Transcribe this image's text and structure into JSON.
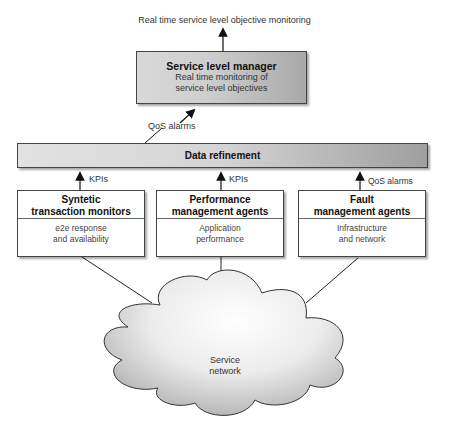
{
  "diagram": {
    "top_output_label": "Real time service level objective monitoring",
    "service_level_manager": {
      "title": "Service level manager",
      "line1": "Real time monitoring of",
      "line2": "service level objectives"
    },
    "qos_alarms_to_manager": "QoS alarms",
    "data_refinement": "Data refinement",
    "agents": [
      {
        "title1": "Syntetic",
        "title2": "transaction monitors",
        "desc1": "e2e response",
        "desc2": "and availability",
        "arrow_label": "KPIs"
      },
      {
        "title1": "Performance",
        "title2": "management agents",
        "desc1": "Application",
        "desc2": "performance",
        "arrow_label": "KPIs"
      },
      {
        "title1": "Fault",
        "title2": "management agents",
        "desc1": "Infrastructure",
        "desc2": "and network",
        "arrow_label": "QoS alarms"
      }
    ],
    "cloud": {
      "line1": "Service",
      "line2": "network"
    },
    "colors": {
      "box_light": "#d8d8d8",
      "box_dark": "#a0a0a0",
      "stroke": "#222222"
    }
  }
}
